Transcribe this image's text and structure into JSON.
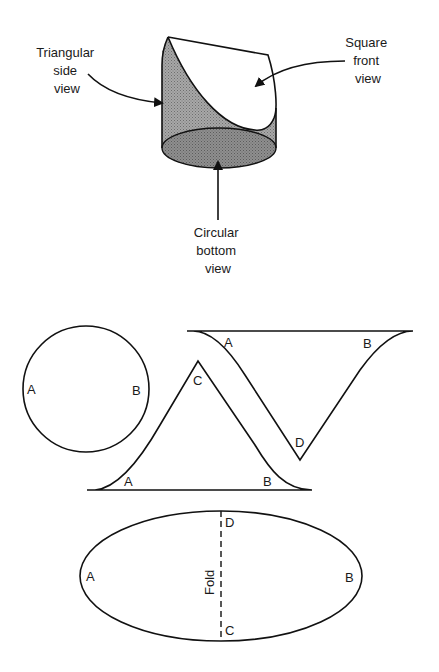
{
  "figure_top": {
    "title": "Cylinder cut to produce three views",
    "labels": {
      "side": [
        "Triangular",
        "side",
        "view"
      ],
      "front": [
        "Square",
        "front",
        "view"
      ],
      "bottom": [
        "Circular",
        "bottom",
        "view"
      ]
    },
    "colors": {
      "shade": "#9a9a9a",
      "shade_dark": "#7d7d7d",
      "line": "#111111"
    }
  },
  "figure_bottom": {
    "circle": {
      "left": "A",
      "right": "B"
    },
    "triangle_up": {
      "left": "A",
      "right": "B",
      "apex": "C"
    },
    "triangle_down": {
      "left": "A",
      "right": "B",
      "apex": "D"
    },
    "ellipse": {
      "left": "A",
      "right": "B",
      "top": "D",
      "bottom": "C",
      "fold": "Fold"
    }
  }
}
